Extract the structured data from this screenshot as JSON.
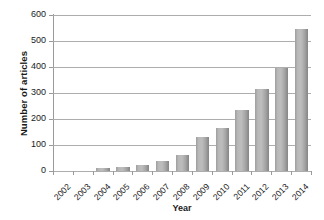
{
  "chart_data": {
    "type": "bar",
    "title": "",
    "xlabel": "Year",
    "ylabel": "Number of articles",
    "categories": [
      "2002",
      "2003",
      "2004",
      "2005",
      "2006",
      "2007",
      "2008",
      "2009",
      "2010",
      "2011",
      "2012",
      "2013",
      "2014"
    ],
    "values": [
      0,
      2,
      13,
      17,
      25,
      37,
      63,
      131,
      165,
      234,
      315,
      397,
      545
    ],
    "ylim": [
      0,
      600
    ],
    "yticks": [
      0,
      100,
      200,
      300,
      400,
      500,
      600
    ],
    "ytick_labels": [
      "0",
      "100",
      "200",
      "300",
      "400",
      "500",
      "600"
    ],
    "grid": true,
    "legend": "none",
    "series_color": "#b0b0b0"
  }
}
